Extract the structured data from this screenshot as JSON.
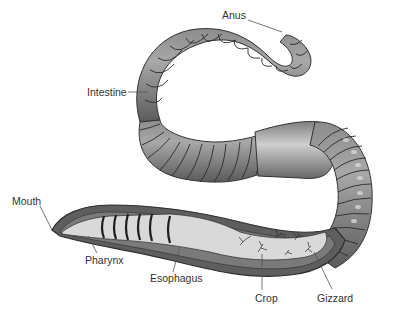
{
  "diagram": {
    "labels": {
      "anus": "Anus",
      "intestine": "Intestine",
      "mouth": "Mouth",
      "pharynx": "Pharynx",
      "esophagus": "Esophagus",
      "crop": "Crop",
      "gizzard": "Gizzard"
    },
    "colors": {
      "body": "#7a7a7a",
      "body_dark": "#4a4a4a",
      "segment_line": "#2a2a2a",
      "gut": "#d9d9d9",
      "label_text": "#333333",
      "leader_line": "#555555"
    }
  }
}
